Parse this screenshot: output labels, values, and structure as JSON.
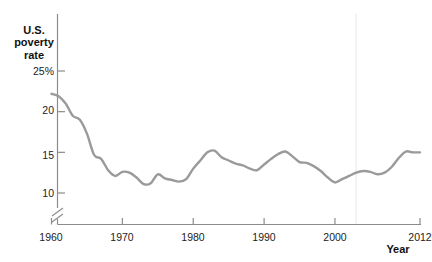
{
  "figure": {
    "cut_caption": "",
    "axis_break": true
  },
  "chart_data": {
    "type": "line",
    "title": "",
    "xlabel": "Year",
    "ylabel": "U.S. poverty rate",
    "ylabel_lines": [
      "U.S.",
      "poverty",
      "rate"
    ],
    "xlim": [
      1960,
      2012
    ],
    "ylim": [
      9,
      25
    ],
    "grid": false,
    "legend": null,
    "yticks": [
      10,
      15,
      20,
      25
    ],
    "ytick_labels": [
      "10",
      "15",
      "20",
      "25%"
    ],
    "xticks": [
      1960,
      1970,
      1980,
      1990,
      2000,
      2012
    ],
    "xtick_labels": [
      "1960",
      "1970",
      "1980",
      "1990",
      "2000",
      "2012"
    ],
    "line_color": "#9a9a9a",
    "annotations": [
      {
        "name": "vertical-rule",
        "x": 2003,
        "color": "#f0f0f0"
      }
    ],
    "series": [
      {
        "name": "U.S. poverty rate",
        "x": [
          1960,
          1961,
          1962,
          1963,
          1964,
          1965,
          1966,
          1967,
          1968,
          1969,
          1970,
          1971,
          1972,
          1973,
          1974,
          1975,
          1976,
          1977,
          1978,
          1979,
          1980,
          1981,
          1982,
          1983,
          1984,
          1985,
          1986,
          1987,
          1988,
          1989,
          1990,
          1991,
          1992,
          1993,
          1994,
          1995,
          1996,
          1997,
          1998,
          1999,
          2000,
          2001,
          2002,
          2003,
          2004,
          2005,
          2006,
          2007,
          2008,
          2009,
          2010,
          2011,
          2012
        ],
        "values": [
          22.2,
          21.9,
          21.0,
          19.5,
          19.0,
          17.3,
          14.7,
          14.2,
          12.8,
          12.1,
          12.6,
          12.5,
          11.9,
          11.1,
          11.2,
          12.3,
          11.8,
          11.6,
          11.4,
          11.7,
          13.0,
          14.0,
          15.0,
          15.2,
          14.4,
          14.0,
          13.6,
          13.4,
          13.0,
          12.8,
          13.5,
          14.2,
          14.8,
          15.1,
          14.5,
          13.8,
          13.7,
          13.3,
          12.7,
          11.9,
          11.3,
          11.7,
          12.1,
          12.5,
          12.7,
          12.6,
          12.3,
          12.5,
          13.2,
          14.3,
          15.1,
          15.0,
          15.0
        ]
      }
    ]
  }
}
